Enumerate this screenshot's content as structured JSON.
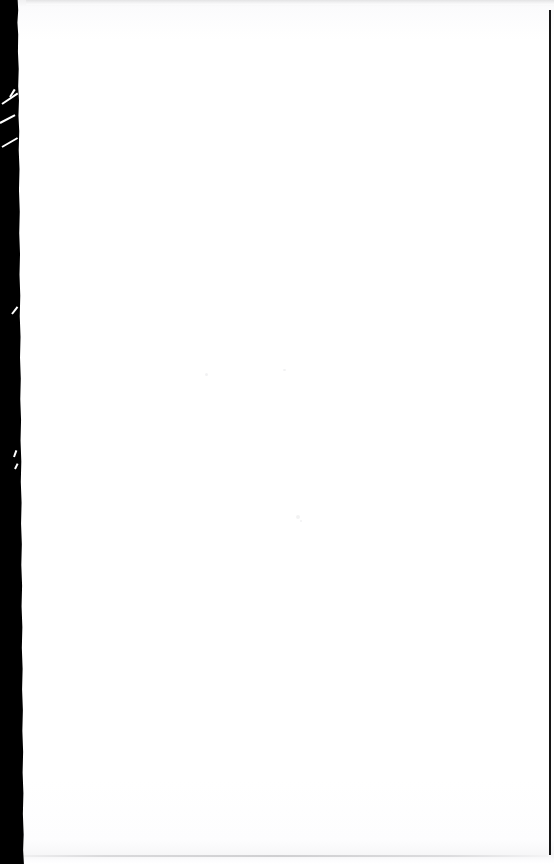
{
  "document": {
    "kind": "scanned-page",
    "page_text": "",
    "notes": ""
  },
  "canvas": {
    "width": "554",
    "height": "864",
    "background_color": "#ffffff"
  },
  "page": {
    "surface_color": "#fdfdfd",
    "content_text": ""
  },
  "artifacts": {
    "gutter": {
      "name": "left-scan-gutter",
      "color": "#000000",
      "width": "26"
    },
    "right_edge": {
      "name": "right-edge-rule",
      "color": "#161616"
    },
    "top_edge": {
      "name": "top-shadow-band",
      "color": "#e3e3e4"
    },
    "bottom_edge": {
      "name": "bottom-shadow-rule",
      "color": "#cfcfd1"
    },
    "tears": [
      {
        "name": "tear-streak-1"
      },
      {
        "name": "tear-streak-2"
      },
      {
        "name": "tear-streak-3"
      },
      {
        "name": "tear-streak-4"
      },
      {
        "name": "tear-streak-5"
      },
      {
        "name": "tear-streak-6"
      },
      {
        "name": "tear-streak-7"
      }
    ],
    "specks": [
      {
        "name": "speck-1"
      },
      {
        "name": "speck-2"
      },
      {
        "name": "speck-3"
      },
      {
        "name": "speck-4"
      }
    ]
  }
}
